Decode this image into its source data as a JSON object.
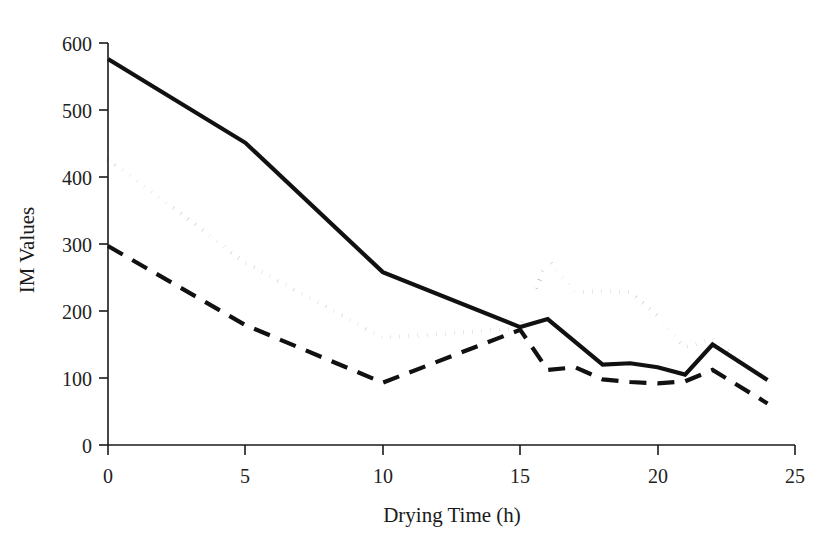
{
  "chart_data": {
    "type": "line",
    "title": "",
    "xlabel": "Drying Time (h)",
    "ylabel": "IM Values",
    "xlim": [
      0,
      25
    ],
    "ylim": [
      0,
      600
    ],
    "xticks": [
      0,
      5,
      10,
      15,
      20,
      25
    ],
    "yticks": [
      0,
      100,
      200,
      300,
      400,
      500,
      600
    ],
    "xtick_labels": [
      "0",
      "5",
      "10",
      "15",
      "20",
      "25"
    ],
    "ytick_labels": [
      "0",
      "100",
      "200",
      "300",
      "400",
      "500",
      "600"
    ],
    "grid": false,
    "legend": "none",
    "series": [
      {
        "name": "solid-series",
        "style": "solid",
        "color": "#111111",
        "x": [
          0,
          5,
          10,
          15,
          16,
          18,
          19,
          20,
          21,
          22,
          24
        ],
        "values": [
          576,
          451,
          258,
          176,
          188,
          120,
          122,
          116,
          105,
          150,
          97
        ]
      },
      {
        "name": "dotted-series",
        "style": "dotted",
        "color": "#111111",
        "x": [
          0,
          5,
          10,
          15,
          16,
          17,
          18,
          19,
          20,
          21,
          22,
          24
        ],
        "values": [
          427,
          272,
          160,
          174,
          277,
          228,
          230,
          228,
          192,
          146,
          158,
          92
        ]
      },
      {
        "name": "dashed-series",
        "style": "dashed",
        "color": "#111111",
        "x": [
          0,
          5,
          10,
          15,
          16,
          17,
          18,
          19,
          20,
          21,
          22,
          24
        ],
        "values": [
          297,
          179,
          93,
          172,
          112,
          116,
          98,
          94,
          92,
          95,
          112,
          62
        ]
      }
    ]
  },
  "axes": {
    "y_title": "IM Values",
    "x_title": "Drying Time (h)",
    "y_ticks": [
      {
        "label": "600"
      },
      {
        "label": "500"
      },
      {
        "label": "400"
      },
      {
        "label": "300"
      },
      {
        "label": "200"
      },
      {
        "label": "100"
      },
      {
        "label": "0"
      }
    ],
    "x_ticks": [
      {
        "label": "0"
      },
      {
        "label": "5"
      },
      {
        "label": "10"
      },
      {
        "label": "15"
      },
      {
        "label": "20"
      },
      {
        "label": "25"
      }
    ]
  }
}
